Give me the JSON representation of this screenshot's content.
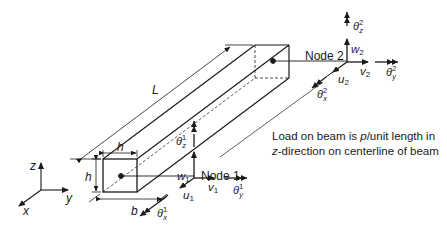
{
  "figure": {
    "type": "3D beam element with nodal degrees of freedom",
    "dimensions": {
      "length": "L",
      "height": "h",
      "width": "b",
      "top_width_label": "h"
    },
    "global_axes": [
      "x",
      "y",
      "z"
    ],
    "nodes": [
      {
        "label": "Node 1",
        "dofs": [
          "u1",
          "v1",
          "w1",
          "θx1",
          "θy1",
          "θz1"
        ]
      },
      {
        "label": "Node 2",
        "dofs": [
          "u2",
          "v2",
          "w2",
          "θx2",
          "θy2",
          "θz2"
        ]
      }
    ]
  },
  "labels": {
    "L": "L",
    "h_top": "h",
    "h_side": "h",
    "b": "b",
    "axis_x": "x",
    "axis_y": "y",
    "axis_z": "z",
    "node1": "Node 1",
    "node2": "Node 2",
    "u1": "u",
    "u1_sub": "1",
    "v1": "v",
    "v1_sub": "1",
    "w1": "w",
    "w1_sub": "1",
    "u2": "u",
    "u2_sub": "2",
    "v2": "v",
    "v2_sub": "2",
    "w2": "w",
    "w2_sub": "2",
    "theta": "θ",
    "sub_x": "x",
    "sub_y": "y",
    "sub_z": "z",
    "sup_1": "1",
    "sup_2": "2"
  },
  "note": {
    "line1_pre": "Load on beam is ",
    "line1_var": "p",
    "line1_post": "/unit length in",
    "line2_var": "z",
    "line2_post": "-direction on centerline of beam"
  },
  "colors": {
    "ink": "#1a1a1a",
    "background": "#ffffff"
  }
}
